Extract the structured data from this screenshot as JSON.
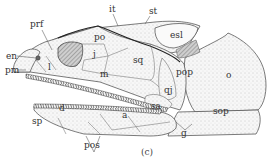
{
  "figure": {
    "caption": "(c)",
    "labels": {
      "prf": "prf",
      "it": "it",
      "st": "st",
      "esl": "esl",
      "po": "po",
      "j": "j",
      "en": "en",
      "pm": "pm",
      "l": "l",
      "m": "m",
      "sq": "sq",
      "pop": "pop",
      "o": "o",
      "qj": "qj",
      "sop": "sop",
      "sp": "sp",
      "d": "d",
      "a": "a",
      "sa": "sa",
      "pos": "pos",
      "g": "g"
    },
    "colors": {
      "line": "#333333",
      "stipple": "#cfcfcf",
      "orbit": "#8a8a8a",
      "background": "#ffffff"
    }
  }
}
